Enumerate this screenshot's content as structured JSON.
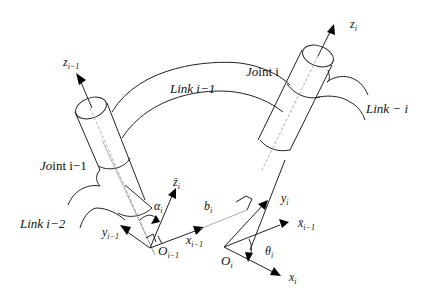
{
  "diagram": {
    "type": "robot-link-joint-frames",
    "labels": {
      "z_prev": {
        "base": "z",
        "sub": "i−1"
      },
      "z_i": {
        "base": "z",
        "sub": "i"
      },
      "link_prev": "Link i−1",
      "joint_i": {
        "italic": "Jo",
        "rest": "int i"
      },
      "link_i": "Link − i",
      "joint_prev": {
        "italic": "Jo",
        "rest": "int i−1"
      },
      "link_prev2": "Link i−2",
      "zbar_i": {
        "base": "z̄",
        "sub": "i"
      },
      "alpha_i": {
        "base": "α",
        "sub": "i"
      },
      "b_i": {
        "base": "b",
        "sub": "i"
      },
      "y_prev": {
        "base": "y",
        "sub": "i−1"
      },
      "x_prev": {
        "base": "x",
        "sub": "i−1"
      },
      "O_prev": {
        "base": "O",
        "sub": "i−1"
      },
      "y_i": {
        "base": "y",
        "sub": "i"
      },
      "xbar_prev": {
        "base": "x̄",
        "sub": "i−1"
      },
      "theta_i": {
        "base": "θ",
        "sub": "i"
      },
      "O_i": {
        "base": "O",
        "sub": "i"
      },
      "x_i": {
        "base": "x",
        "sub": "i"
      }
    },
    "colors": {
      "stroke": "#222222",
      "background": "#ffffff"
    }
  }
}
